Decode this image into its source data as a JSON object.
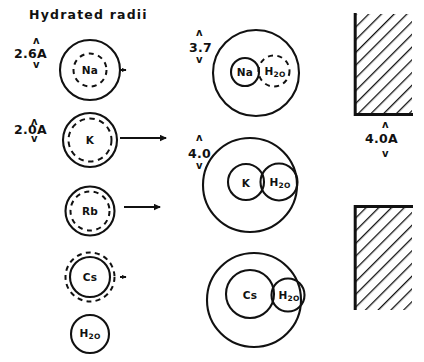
{
  "figure": {
    "title": "Hydrated  radii",
    "background": "#ffffff",
    "ink": "#111111"
  },
  "left_column": {
    "heading": "Hydrated radii",
    "dimensions": [
      {
        "value": "2.6A",
        "for": "Na"
      },
      {
        "value": "2.0A",
        "for": "K"
      }
    ],
    "species": [
      {
        "label": "Na",
        "sub": "",
        "style": "solid-outer-dashed-inner"
      },
      {
        "label": "K",
        "sub": "",
        "style": "solid-outer-dashed-inner"
      },
      {
        "label": "Rb",
        "sub": "",
        "style": "solid-outer-dashed-inner"
      },
      {
        "label": "Cs",
        "sub": "",
        "style": "dashed-outer-solid-inner"
      },
      {
        "label": "H",
        "sub": "2O",
        "style": "solid"
      }
    ]
  },
  "arrows": [
    {
      "row": "Na",
      "kind": "short-stub"
    },
    {
      "row": "K",
      "kind": "long-arrow"
    },
    {
      "row": "Rb",
      "kind": "long-arrow"
    },
    {
      "row": "Cs",
      "kind": "short-stub"
    }
  ],
  "middle_column": {
    "dimensions": [
      {
        "value": "3.7",
        "for": "Na-hydrated"
      },
      {
        "value": "4.0",
        "for": "K-hydrated"
      }
    ],
    "complexes": [
      {
        "ion": "Na",
        "water": "H2O",
        "ion_style": "solid",
        "water_style": "dashed"
      },
      {
        "ion": "K",
        "water": "H2O",
        "ion_style": "solid",
        "water_style": "solid"
      },
      {
        "ion": "Cs",
        "water": "H2O",
        "ion_style": "solid",
        "water_style": "solid"
      }
    ]
  },
  "right_column": {
    "pore_label": "4.0A",
    "blocks": [
      {
        "name": "upper-membrane-block",
        "hatch": "diagonal"
      },
      {
        "name": "lower-membrane-block",
        "hatch": "diagonal"
      }
    ]
  },
  "glyphs": {
    "caret_up": "ʌ",
    "caret_down": "v"
  }
}
